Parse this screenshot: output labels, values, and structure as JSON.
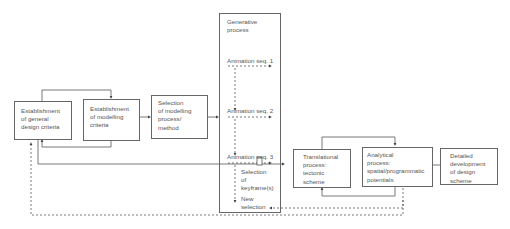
{
  "diagram": {
    "boxes": {
      "general_criteria": {
        "lines": [
          "Establishment",
          "of general",
          "design criteria"
        ]
      },
      "modelling_criteria": {
        "lines": [
          "Establishment",
          "of modelling",
          "criteria"
        ]
      },
      "selection_method": {
        "lines": [
          "Selection",
          "of modelling",
          "process/",
          "method"
        ]
      },
      "generative_process": {
        "lines": [
          "Generative",
          "process"
        ]
      },
      "translational": {
        "lines": [
          "Translational",
          "process:",
          "tectonic",
          "scheme"
        ]
      },
      "analytical": {
        "lines": [
          "Analytical",
          "process:",
          "spatial/programmatic",
          "potentials"
        ]
      },
      "detailed": {
        "lines": [
          "Detailed",
          "development",
          "of design",
          "scheme"
        ]
      }
    },
    "generative_items": {
      "seq1": "Animation seq. 1",
      "seq2": "Animation seq. 2",
      "seq3": "Animation seq. 3",
      "keyframes": [
        "Selection",
        "of",
        "keyframe(s)"
      ],
      "new_selection": [
        "New",
        "selection"
      ]
    },
    "colors": {
      "line": "#555555",
      "border": "#666666",
      "text": "#555555"
    }
  }
}
